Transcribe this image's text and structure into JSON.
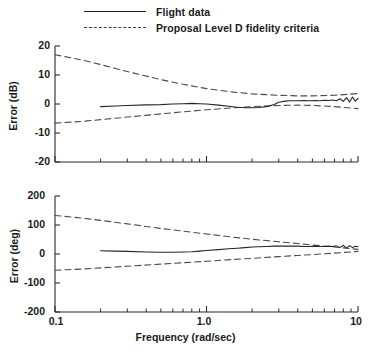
{
  "legend": {
    "position": "top-left",
    "items": [
      {
        "label": "Flight data",
        "style": "solid"
      },
      {
        "label": "Proposal Level D fidelity criteria",
        "style": "dashed"
      }
    ]
  },
  "axis": {
    "x_title": "Frequency (rad/sec)",
    "x_ticks": [
      "0.1",
      "1.0",
      "10"
    ],
    "x_tick_values": [
      0.1,
      1.0,
      10
    ],
    "x_scale": "log",
    "x_range": [
      0.1,
      10
    ]
  },
  "chart_data": [
    {
      "type": "line",
      "id": "magnitude-error",
      "title": "",
      "xlabel": "Frequency (rad/sec)",
      "ylabel": "Error (dB)",
      "xscale": "log",
      "xlim": [
        0.1,
        10
      ],
      "ylim": [
        -20,
        20
      ],
      "yticks": [
        20,
        10,
        0,
        -10,
        -20
      ],
      "ytick_labels": [
        "20",
        "10",
        "0",
        "-10",
        "-20"
      ],
      "grid": false,
      "legend_position": "above-plot",
      "series": [
        {
          "name": "Proposal Level D fidelity criteria",
          "role": "upper-bound",
          "style": "dashed",
          "x": [
            0.1,
            0.15,
            0.2,
            0.3,
            0.5,
            0.7,
            1.0,
            1.5,
            2.0,
            3.0,
            4.0,
            5.0,
            7.0,
            10.0
          ],
          "y": [
            17.0,
            15.2,
            13.6,
            11.2,
            8.4,
            6.8,
            5.3,
            4.1,
            3.5,
            3.0,
            2.8,
            2.8,
            3.0,
            3.6
          ]
        },
        {
          "name": "Proposal Level D fidelity criteria",
          "role": "lower-bound",
          "style": "dashed",
          "x": [
            0.1,
            0.15,
            0.2,
            0.3,
            0.5,
            0.7,
            1.0,
            1.5,
            2.0,
            3.0,
            4.0,
            5.0,
            7.0,
            10.0
          ],
          "y": [
            -6.6,
            -6.0,
            -5.4,
            -4.5,
            -3.4,
            -2.7,
            -2.0,
            -1.3,
            -0.9,
            -0.5,
            -0.4,
            -0.5,
            -0.9,
            -1.6
          ]
        },
        {
          "name": "Flight data",
          "role": "measured",
          "style": "solid",
          "x": [
            0.2,
            0.25,
            0.3,
            0.4,
            0.5,
            0.6,
            0.7,
            0.8,
            0.9,
            1.0,
            1.2,
            1.4,
            1.6,
            1.8,
            2.0,
            2.2,
            2.5,
            2.8,
            3.0,
            3.3,
            3.6,
            4.0,
            4.4,
            4.8,
            5.2,
            5.6,
            6.0,
            6.4,
            6.8,
            7.2,
            7.6,
            8.0,
            8.4,
            8.8,
            9.2,
            9.6,
            10.0
          ],
          "y": [
            -0.9,
            -0.7,
            -0.5,
            -0.3,
            -0.2,
            0.0,
            0.1,
            0.2,
            0.1,
            0.0,
            -0.4,
            -0.8,
            -1.1,
            -1.3,
            -1.3,
            -1.2,
            -0.9,
            -0.2,
            0.6,
            1.0,
            1.1,
            1.1,
            1.2,
            1.1,
            1.2,
            1.1,
            1.3,
            1.2,
            1.4,
            1.1,
            1.8,
            0.9,
            2.2,
            0.7,
            2.4,
            1.0,
            1.9
          ]
        }
      ]
    },
    {
      "type": "line",
      "id": "phase-error",
      "title": "",
      "xlabel": "Frequency (rad/sec)",
      "ylabel": "Error (deg)",
      "xscale": "log",
      "xlim": [
        0.1,
        10
      ],
      "ylim": [
        -200,
        200
      ],
      "yticks": [
        200,
        100,
        0,
        -100,
        -200
      ],
      "ytick_labels": [
        "200",
        "100",
        "0",
        "-100",
        "-200"
      ],
      "grid": false,
      "legend_position": "none",
      "series": [
        {
          "name": "Proposal Level D fidelity criteria",
          "role": "upper-bound",
          "style": "dashed",
          "x": [
            0.1,
            0.15,
            0.2,
            0.3,
            0.5,
            0.7,
            1.0,
            1.5,
            2.0,
            3.0,
            4.0,
            5.0,
            7.0,
            10.0
          ],
          "y": [
            133,
            124,
            116,
            104,
            88,
            79,
            69,
            58,
            51,
            42,
            36,
            31,
            24,
            16
          ]
        },
        {
          "name": "Proposal Level D fidelity criteria",
          "role": "lower-bound",
          "style": "dashed",
          "x": [
            0.1,
            0.15,
            0.2,
            0.3,
            0.5,
            0.7,
            1.0,
            1.5,
            2.0,
            3.0,
            4.0,
            5.0,
            7.0,
            10.0
          ],
          "y": [
            -56,
            -52,
            -48,
            -42,
            -35,
            -30,
            -25,
            -19,
            -15,
            -9,
            -5,
            -2,
            3,
            9
          ]
        },
        {
          "name": "Flight data",
          "role": "measured",
          "style": "solid",
          "x": [
            0.2,
            0.25,
            0.3,
            0.4,
            0.5,
            0.6,
            0.7,
            0.8,
            0.9,
            1.0,
            1.2,
            1.4,
            1.6,
            1.8,
            2.0,
            2.2,
            2.5,
            2.8,
            3.0,
            3.3,
            3.6,
            4.0,
            4.4,
            4.8,
            5.2,
            5.6,
            6.0,
            6.4,
            6.8,
            7.2,
            7.6,
            8.0,
            8.4,
            8.8,
            9.2,
            9.6,
            10.0
          ],
          "y": [
            11,
            10,
            9,
            7,
            6,
            6,
            7,
            8,
            10,
            12,
            15,
            18,
            20,
            22,
            24,
            25,
            26,
            27,
            27,
            27,
            27,
            27,
            26,
            26,
            27,
            26,
            26,
            27,
            26,
            28,
            22,
            30,
            20,
            29,
            22,
            27,
            25
          ]
        }
      ]
    }
  ]
}
